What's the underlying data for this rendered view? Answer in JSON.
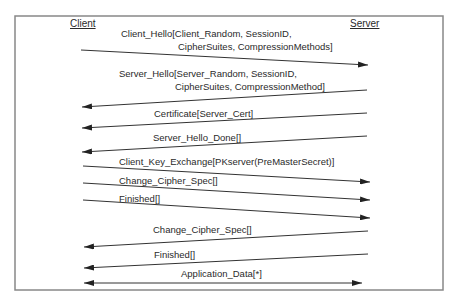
{
  "diagram": {
    "type": "sequence",
    "frame": {
      "x": 15,
      "y": 16,
      "w": 428,
      "h": 274,
      "color": "#888888"
    },
    "actors": [
      {
        "name": "Client",
        "x": 70,
        "y": 27
      },
      {
        "name": "Server",
        "x": 350,
        "y": 27
      }
    ],
    "messages": [
      {
        "id": "client-hello",
        "from": "Client",
        "to": "Server",
        "lines": [
          "Client_Hello[Client_Random, SessionID,",
          "CipherSuites, CompressionMethods]"
        ],
        "label_pos": [
          [
            121,
            37
          ],
          [
            178,
            50
          ]
        ],
        "x1": 81,
        "y1": 50,
        "x2": 368,
        "y2": 65
      },
      {
        "id": "server-hello",
        "from": "Server",
        "to": "Client",
        "lines": [
          "Server_Hello[Server_Random, SessionID,",
          "CipherSuites, CompressionMethod]"
        ],
        "label_pos": [
          [
            119,
            77
          ],
          [
            175,
            90
          ]
        ],
        "x1": 367,
        "y1": 90,
        "x2": 82,
        "y2": 107
      },
      {
        "id": "certificate",
        "from": "Server",
        "to": "Client",
        "lines": [
          "Certificate[Server_Cert]"
        ],
        "label_pos": [
          [
            154,
            117
          ]
        ],
        "x1": 367,
        "y1": 113,
        "x2": 82,
        "y2": 128
      },
      {
        "id": "server-hello-done",
        "from": "Server",
        "to": "Client",
        "lines": [
          "Server_Hello_Done[]"
        ],
        "label_pos": [
          [
            153,
            141
          ]
        ],
        "x1": 367,
        "y1": 136,
        "x2": 82,
        "y2": 152
      },
      {
        "id": "client-key-exchange",
        "from": "Client",
        "to": "Server",
        "lines": [
          "Client_Key_Exchange[PKserver(PreMasterSecret)]"
        ],
        "label_pos": [
          [
            119,
            165
          ]
        ],
        "x1": 83,
        "y1": 166,
        "x2": 370,
        "y2": 182
      },
      {
        "id": "change-cipher-spec-client",
        "from": "Client",
        "to": "Server",
        "lines": [
          "Change_Cipher_Spec[]"
        ],
        "label_pos": [
          [
            119,
            184
          ]
        ],
        "x1": 83,
        "y1": 183,
        "x2": 370,
        "y2": 200
      },
      {
        "id": "finished-client",
        "from": "Client",
        "to": "Server",
        "lines": [
          "Finished[]"
        ],
        "label_pos": [
          [
            119,
            202
          ]
        ],
        "x1": 83,
        "y1": 200,
        "x2": 370,
        "y2": 218
      },
      {
        "id": "change-cipher-spec-server",
        "from": "Server",
        "to": "Client",
        "lines": [
          "Change_Cipher_Spec[]"
        ],
        "label_pos": [
          [
            153,
            233
          ]
        ],
        "x1": 368,
        "y1": 231,
        "x2": 84,
        "y2": 247
      },
      {
        "id": "finished-server",
        "from": "Server",
        "to": "Client",
        "lines": [
          "Finished[]"
        ],
        "label_pos": [
          [
            154,
            258
          ]
        ],
        "x1": 368,
        "y1": 254,
        "x2": 84,
        "y2": 268
      },
      {
        "id": "application-data",
        "from": "Both",
        "to": "Both",
        "lines": [
          "Application_Data[*]"
        ],
        "label_pos": [
          [
            181,
            277
          ]
        ],
        "x1": 84,
        "y1": 283,
        "x2": 362,
        "y2": 283,
        "bidirectional": true
      }
    ]
  }
}
